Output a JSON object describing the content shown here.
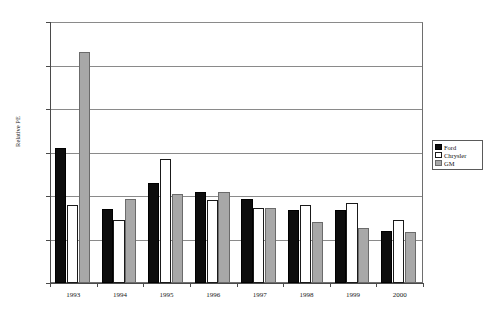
{
  "chart_data": {
    "type": "bar",
    "title": "",
    "subtitle": "",
    "xlabel": "",
    "ylabel": "Relative PE",
    "ylim": [
      0.0,
      1.2
    ],
    "ytick_step": 0.2,
    "ytick_labels": [
      "0.00",
      "0.20",
      "0.40",
      "0.60",
      "0.80",
      "1.00",
      "1.20"
    ],
    "ytick_values": [
      0.0,
      0.2,
      0.4,
      0.6,
      0.8,
      1.0,
      1.2
    ],
    "grid": "horizontal",
    "legend_position": "right-middle",
    "categories": [
      "1993",
      "1994",
      "1995",
      "1996",
      "1997",
      "1998",
      "1999",
      "2000"
    ],
    "series": [
      {
        "name": "Ford",
        "color": "#0d0d0d",
        "values": [
          0.62,
          0.34,
          0.46,
          0.42,
          0.385,
          0.335,
          0.335,
          0.24
        ]
      },
      {
        "name": "Chrysler",
        "color": "#ffffff",
        "values": [
          0.36,
          0.29,
          0.57,
          0.38,
          0.345,
          0.36,
          0.37,
          0.29
        ]
      },
      {
        "name": "GM",
        "color": "#a8a8a8",
        "values": [
          1.06,
          0.385,
          0.41,
          0.42,
          0.345,
          0.28,
          0.255,
          0.235
        ]
      }
    ]
  },
  "legend": {
    "items": [
      {
        "label": "Ford",
        "swatch": "ford"
      },
      {
        "label": "Chrysler",
        "swatch": "chrysler"
      },
      {
        "label": "GM",
        "swatch": "gm"
      }
    ]
  },
  "axes": {
    "y_title": "Relative PE"
  }
}
